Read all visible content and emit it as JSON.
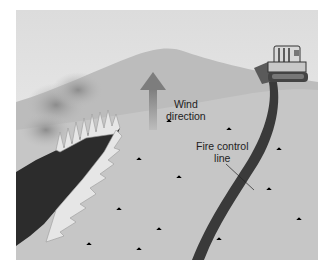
{
  "figure": {
    "labels": {
      "wind": {
        "line1": "Wind",
        "line2": "direction"
      },
      "control_line": {
        "line1": "Fire control",
        "line2": "line"
      }
    },
    "colors": {
      "sky": "#ececec",
      "hill": "#b8b8b8",
      "slope": "#c4c4c4",
      "burned": "#2c2c2c",
      "flame": "#e8e8e8",
      "smoke": "#9a9a9a",
      "arrow": "#8a8a8a",
      "control_line": "#3a3a3a"
    }
  }
}
